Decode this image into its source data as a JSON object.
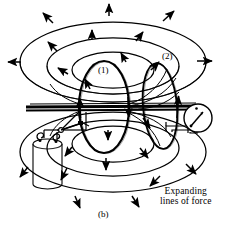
{
  "figure": {
    "caption": "(b)",
    "annotation_line1": "Expanding",
    "annotation_line2": "lines of force",
    "loop1_label": "(1)",
    "loop2_label": "(2)",
    "domain": "Diagram"
  },
  "colors": {
    "stroke": "#000000",
    "background": "#ffffff",
    "text": "#000000"
  },
  "icons": {
    "galvanometer": "meter-icon",
    "battery": "battery-icon",
    "switch": "switch-icon",
    "field_arrow": "arrow-icon"
  },
  "components": [
    {
      "name": "primary-loop",
      "label": "(1)"
    },
    {
      "name": "secondary-loop",
      "label": "(2)"
    },
    {
      "name": "battery",
      "label": ""
    },
    {
      "name": "switch",
      "label": ""
    },
    {
      "name": "galvanometer",
      "label": ""
    }
  ],
  "field_lines": {
    "upper_ellipse_count": 3,
    "lower_ellipse_count": 3,
    "arrow_count": 22,
    "direction": "outward"
  }
}
